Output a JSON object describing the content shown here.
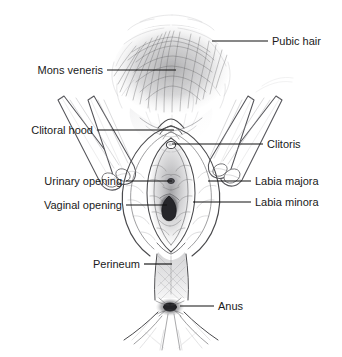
{
  "figure": {
    "background_color": "#ffffff",
    "line_color": "#111111",
    "text_color": "#1a1a1a",
    "width": 342,
    "height": 357
  },
  "labels": [
    {
      "id": "pubic-hair",
      "text": "Pubic hair",
      "side": "right",
      "text_x": 272,
      "text_y": 45,
      "leader_x1": 212,
      "leader_y1": 41,
      "leader_x2": 268,
      "leader_y2": 41
    },
    {
      "id": "mons-veneris",
      "text": "Mons veneris",
      "side": "left",
      "text_x": 103,
      "text_y": 74,
      "leader_x1": 107,
      "leader_y1": 70,
      "leader_x2": 176,
      "leader_y2": 70
    },
    {
      "id": "clitoral-hood",
      "text": "Clitoral hood",
      "side": "left",
      "text_x": 93,
      "text_y": 134,
      "leader_x1": 97,
      "leader_y1": 130,
      "leader_x2": 174,
      "leader_y2": 130
    },
    {
      "id": "clitoris",
      "text": "Clitoris",
      "side": "right",
      "text_x": 267,
      "text_y": 148,
      "leader_x1": 172,
      "leader_y1": 144,
      "leader_x2": 263,
      "leader_y2": 144
    },
    {
      "id": "urinary-opening",
      "text": "Urinary opening",
      "side": "left",
      "text_x": 122,
      "text_y": 185,
      "leader_x1": 126,
      "leader_y1": 181,
      "leader_x2": 172,
      "leader_y2": 181
    },
    {
      "id": "labia-majora",
      "text": "Labia majora",
      "side": "right",
      "text_x": 255,
      "text_y": 185,
      "leader_x1": 208,
      "leader_y1": 181,
      "leader_x2": 251,
      "leader_y2": 181
    },
    {
      "id": "vaginal-opening",
      "text": "Vaginal opening",
      "side": "left",
      "text_x": 122,
      "text_y": 209,
      "leader_x1": 126,
      "leader_y1": 205,
      "leader_x2": 167,
      "leader_y2": 205
    },
    {
      "id": "labia-minora",
      "text": "Labia minora",
      "side": "right",
      "text_x": 255,
      "text_y": 206,
      "leader_x1": 193,
      "leader_y1": 202,
      "leader_x2": 251,
      "leader_y2": 202
    },
    {
      "id": "perineum",
      "text": "Perineum",
      "side": "left",
      "text_x": 140,
      "text_y": 268,
      "leader_x1": 144,
      "leader_y1": 264,
      "leader_x2": 172,
      "leader_y2": 264
    },
    {
      "id": "anus",
      "text": "Anus",
      "side": "right",
      "text_x": 218,
      "text_y": 310,
      "leader_x1": 180,
      "leader_y1": 306,
      "leader_x2": 214,
      "leader_y2": 306
    }
  ]
}
